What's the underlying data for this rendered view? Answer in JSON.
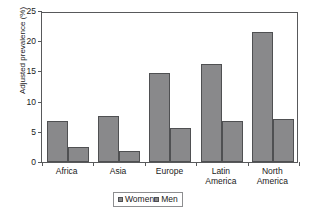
{
  "chart_data": {
    "type": "bar",
    "title": "",
    "xlabel": "",
    "ylabel": "Adjusted prevalence (%)",
    "ylim": [
      0,
      25
    ],
    "yticks": [
      0,
      5,
      10,
      15,
      20,
      25
    ],
    "grid": false,
    "legend_position": "bottom-center",
    "categories": [
      "Africa",
      "Asia",
      "Europe",
      "Latin America",
      "North America"
    ],
    "category_lines": [
      [
        "Africa"
      ],
      [
        "Asia"
      ],
      [
        "Europe"
      ],
      [
        "Latin",
        "America"
      ],
      [
        "North",
        "America"
      ]
    ],
    "series": [
      {
        "name": "Women",
        "color": "#89898b",
        "values": [
          6.8,
          7.6,
          14.7,
          16.2,
          21.5
        ]
      },
      {
        "name": "Men",
        "color": "#89898b",
        "values": [
          2.5,
          1.9,
          5.7,
          6.8,
          7.2
        ]
      }
    ]
  }
}
